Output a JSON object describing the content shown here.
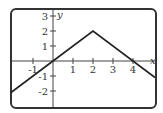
{
  "chart_data": {
    "type": "line",
    "title": "",
    "xlabel": "x",
    "ylabel": "y",
    "xlim": [
      -2.1,
      5.1
    ],
    "ylim": [
      -2.7,
      3.3
    ],
    "x_ticks": [
      -1,
      1,
      2,
      3,
      4
    ],
    "x_tick_labels": [
      "-1",
      "1",
      "2",
      "3",
      "4"
    ],
    "y_ticks": [
      -2,
      -1,
      1,
      2,
      3
    ],
    "y_tick_labels": [
      "-2",
      "-1",
      "1",
      "2",
      "3"
    ],
    "grid": false,
    "series": [
      {
        "name": "f(x)",
        "x": [
          -2.1,
          0,
          2,
          5.1
        ],
        "y": [
          -2.1,
          0,
          2,
          -1.1
        ]
      }
    ]
  },
  "colors": {
    "line": "#222222",
    "axis": "#444444",
    "frame": "#333333",
    "text": "#333333"
  }
}
